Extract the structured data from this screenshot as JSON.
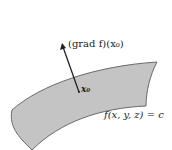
{
  "diagram": {
    "title": "",
    "labels": {
      "gradient": "(grad f)(x₀)",
      "point": "x₀",
      "surface": "f(x, y, z) = c"
    },
    "colors": {
      "surface_fill": "#c4c4c4",
      "surface_stroke": "#6a6a6a",
      "arrow": "#222222",
      "background": "#ffffff"
    }
  }
}
